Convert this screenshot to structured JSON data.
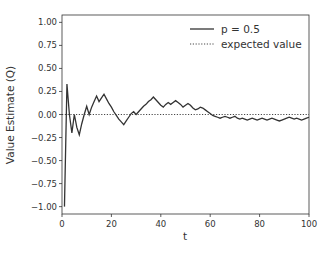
{
  "chart_data": {
    "type": "line",
    "title": "",
    "xlabel": "t",
    "ylabel": "Value Estimate (Q)",
    "xlim": [
      0,
      100
    ],
    "ylim": [
      -1.08,
      1.08
    ],
    "grid": false,
    "legend_position": "upper right",
    "x_ticks": [
      0,
      20,
      40,
      60,
      80,
      100
    ],
    "x_tick_labels": [
      "0",
      "20",
      "40",
      "60",
      "80",
      "100"
    ],
    "y_ticks": [
      1.0,
      0.75,
      0.5,
      0.25,
      0.0,
      -0.25,
      -0.5,
      -0.75,
      -1.0
    ],
    "y_tick_labels": [
      "1.00",
      "0.75",
      "0.50",
      "0.25",
      "0.00",
      "−0.25",
      "−0.50",
      "−0.75",
      "−1.00"
    ],
    "series": [
      {
        "name": "p = 0.5",
        "style": "solid",
        "color": "#333333",
        "x": [
          1,
          2,
          3,
          4,
          5,
          6,
          7,
          8,
          9,
          10,
          11,
          12,
          13,
          14,
          15,
          16,
          17,
          18,
          19,
          20,
          21,
          22,
          23,
          24,
          25,
          26,
          27,
          28,
          29,
          30,
          31,
          32,
          33,
          34,
          35,
          36,
          37,
          38,
          39,
          40,
          41,
          42,
          43,
          44,
          45,
          46,
          47,
          48,
          49,
          50,
          51,
          52,
          53,
          54,
          55,
          56,
          57,
          58,
          59,
          60,
          61,
          62,
          63,
          64,
          65,
          66,
          67,
          68,
          69,
          70,
          71,
          72,
          73,
          74,
          75,
          76,
          77,
          78,
          79,
          80,
          81,
          82,
          83,
          84,
          85,
          86,
          87,
          88,
          89,
          90,
          91,
          92,
          93,
          94,
          95,
          96,
          97,
          98,
          99,
          100
        ],
        "values": [
          -1.0,
          0.33,
          0.0,
          -0.2,
          0.0,
          -0.14,
          -0.22,
          -0.1,
          0.0,
          0.09,
          0.0,
          0.08,
          0.14,
          0.2,
          0.14,
          0.18,
          0.22,
          0.17,
          0.12,
          0.08,
          0.03,
          -0.01,
          -0.05,
          -0.08,
          -0.11,
          -0.07,
          -0.03,
          0.01,
          0.03,
          0.0,
          0.03,
          0.06,
          0.09,
          0.11,
          0.14,
          0.16,
          0.19,
          0.16,
          0.13,
          0.1,
          0.08,
          0.11,
          0.13,
          0.11,
          0.13,
          0.15,
          0.13,
          0.11,
          0.08,
          0.1,
          0.12,
          0.1,
          0.07,
          0.05,
          0.06,
          0.08,
          0.07,
          0.05,
          0.03,
          0.01,
          -0.01,
          -0.02,
          -0.03,
          -0.04,
          -0.03,
          -0.02,
          -0.03,
          -0.04,
          -0.03,
          -0.02,
          -0.04,
          -0.05,
          -0.04,
          -0.05,
          -0.06,
          -0.05,
          -0.04,
          -0.05,
          -0.06,
          -0.05,
          -0.04,
          -0.05,
          -0.06,
          -0.05,
          -0.04,
          -0.05,
          -0.06,
          -0.07,
          -0.06,
          -0.05,
          -0.04,
          -0.03,
          -0.04,
          -0.05,
          -0.04,
          -0.05,
          -0.06,
          -0.05,
          -0.04,
          -0.03
        ]
      },
      {
        "name": "expected value",
        "style": "dotted",
        "color": "#333333",
        "x": [
          0,
          100
        ],
        "values": [
          0.0,
          0.0
        ]
      }
    ]
  },
  "legend": {
    "items": [
      {
        "label": "p = 0.5",
        "style": "solid"
      },
      {
        "label": "expected value",
        "style": "dotted"
      }
    ]
  },
  "axes": {
    "xlabel": "t",
    "ylabel": "Value Estimate (Q)"
  }
}
